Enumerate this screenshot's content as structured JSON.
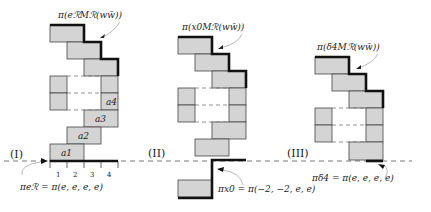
{
  "panels": [
    {
      "id": "I",
      "label": "(I)",
      "top_caption": "π(eℛMℛ(ww̄))",
      "bottom_caption": "πeℛ = π(e, e, e, e)",
      "cell_labels": [
        "a1",
        "a2",
        "a3",
        "a4"
      ],
      "axis_ticks": [
        "1",
        "2",
        "3",
        "4"
      ]
    },
    {
      "id": "II",
      "label": "(II)",
      "top_caption": "π(x0Mℛ(ww̄))",
      "bottom_caption": "πx0 = π(−2, −2, e, e)"
    },
    {
      "id": "III",
      "label": "(III)",
      "top_caption": "π(δ4Mℛ(ww̄))",
      "bottom_caption": "πδ4 = π(e, e, e, e)"
    }
  ],
  "colors": {
    "cell_fill": "#d4d4d4",
    "outline": "#111111",
    "baseline": "#555555"
  }
}
